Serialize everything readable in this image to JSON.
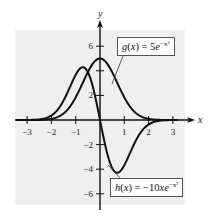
{
  "chart_data": {
    "type": "line",
    "title": "",
    "xlabel": "x",
    "ylabel": "y",
    "xlim": [
      -3.5,
      3.5
    ],
    "ylim": [
      -7,
      7
    ],
    "grid": false,
    "background_color": "#efefef",
    "x_ticks": [
      -3,
      -2,
      -1,
      1,
      2,
      3
    ],
    "x_tick_labels": [
      "−3",
      "−2",
      "−1",
      "1",
      "2",
      "3"
    ],
    "y_ticks": [
      -6,
      -4,
      -2,
      2,
      4,
      6
    ],
    "y_tick_labels": [
      "−6",
      "−4",
      "−2",
      "2",
      "",
      "6"
    ],
    "series": [
      {
        "name": "g(x) = 5e^{-x^2}",
        "label_text": {
          "fn": "g",
          "var": "x",
          "lhs_rest": ") = 5",
          "base": "e",
          "exp": "−x²"
        },
        "formula": "5*exp(-x^2)",
        "x": [
          -3,
          -2,
          -1.5,
          -1,
          -0.5,
          0,
          0.5,
          1,
          1.5,
          2,
          3
        ],
        "values": [
          0.0006,
          0.09,
          0.53,
          1.84,
          3.89,
          5.0,
          3.89,
          1.84,
          0.53,
          0.09,
          0.0006
        ]
      },
      {
        "name": "h(x) = -10xe^{-x^2}",
        "label_text": {
          "fn": "h",
          "var": "x",
          "lhs_rest": ") = −10",
          "mid": "x",
          "base": "e",
          "exp": "−x²"
        },
        "formula": "-10*x*exp(-x^2)",
        "x": [
          -3,
          -2,
          -1.5,
          -1,
          -0.707,
          -0.5,
          0,
          0.5,
          0.707,
          1,
          1.5,
          2,
          3
        ],
        "values": [
          0.004,
          0.37,
          1.58,
          3.68,
          4.29,
          3.89,
          0,
          -3.89,
          -4.29,
          -3.68,
          -1.58,
          -0.37,
          -0.004
        ]
      }
    ],
    "annotations": [
      {
        "text": "g(x) = 5e^{-x^2}",
        "position": "upper right, leader line to g curve"
      },
      {
        "text": "h(x) = -10xe^{-x^2}",
        "position": "lower right, leader line to h minimum"
      }
    ]
  }
}
